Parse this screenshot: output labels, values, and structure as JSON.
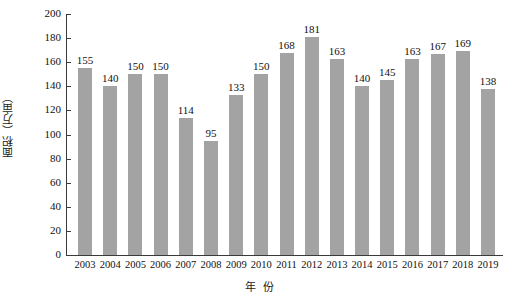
{
  "chart_data": {
    "type": "bar",
    "title": "",
    "xlabel": "年　份",
    "ylabel": "面积（万亩）",
    "categories": [
      "2003",
      "2004",
      "2005",
      "2006",
      "2007",
      "2008",
      "2009",
      "2010",
      "2011",
      "2012",
      "2013",
      "2014",
      "2015",
      "2016",
      "2017",
      "2018",
      "2019"
    ],
    "values": [
      155,
      140,
      150,
      150,
      114,
      95,
      133,
      150,
      168,
      181,
      163,
      140,
      145,
      163,
      167,
      169,
      138
    ],
    "value_labels": [
      "155",
      "140",
      "150",
      "150",
      "114",
      "95",
      "133",
      "150",
      "168",
      "181",
      "163",
      "140",
      "145",
      "163",
      "167",
      "169",
      "138"
    ],
    "ylim": [
      0,
      200
    ],
    "ytick_labels": [
      "0",
      "20",
      "40",
      "60",
      "80",
      "100",
      "120",
      "140",
      "160",
      "180",
      "200"
    ],
    "ytick_values": [
      0,
      20,
      40,
      60,
      80,
      100,
      120,
      140,
      160,
      180,
      200
    ],
    "grid": false,
    "legend": "none",
    "bar_color": "#a3a3a3",
    "axis_color": "#3a3a3a",
    "text_color": "#111111"
  },
  "axis_titles": {
    "y": "面积（万亩）",
    "x_part1": "年",
    "x_part2": "份"
  }
}
